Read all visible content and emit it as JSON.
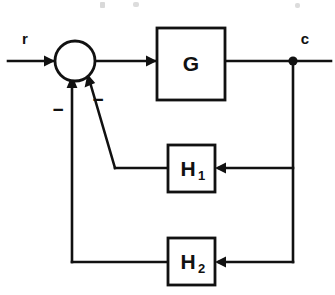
{
  "diagram": {
    "type": "control-system-block-diagram",
    "canvas": {
      "width": 335,
      "height": 295
    },
    "colors": {
      "ink": "#111111",
      "background": "#ffffff"
    }
  },
  "signals": {
    "input": {
      "label": "r",
      "x": 25,
      "y": 40
    },
    "output": {
      "label": "c",
      "x": 305,
      "y": 40
    }
  },
  "blocks": [
    {
      "id": "G",
      "label": "G",
      "subscript": "",
      "x": 157,
      "y": 28,
      "width": 68,
      "height": 72,
      "center_x": 191,
      "center_y": 64
    },
    {
      "id": "H1",
      "label": "H",
      "subscript": "1",
      "x": 168,
      "y": 145,
      "width": 47,
      "height": 47,
      "center_x": 191,
      "center_y": 170
    },
    {
      "id": "H2",
      "label": "H",
      "subscript": "2",
      "x": 168,
      "y": 238,
      "width": 47,
      "height": 47,
      "center_x": 191,
      "center_y": 263
    }
  ],
  "summing_junction": {
    "name": "summing-junction",
    "center_x": 75,
    "center_y": 61,
    "radius": 20,
    "signs": [
      {
        "label": "−",
        "x": 58,
        "y": 111,
        "for": "H2-feedback"
      },
      {
        "label": "−",
        "x": 98,
        "y": 101,
        "for": "H1-feedback"
      }
    ]
  },
  "nodes": [
    {
      "name": "takeoff-node-c",
      "x": 293,
      "y": 61,
      "radius": 4.6
    }
  ],
  "wires": {
    "input_line": {
      "from_x": 8,
      "to_x": 55,
      "y": 61
    },
    "sum_to_g": {
      "from_x": 95,
      "to_x": 157,
      "y": 61
    },
    "g_to_node": {
      "from_x": 225,
      "to_x": 293,
      "y": 61
    },
    "node_to_c": {
      "from_x": 293,
      "to_x": 331,
      "y": 61
    },
    "right_rail": {
      "x": 293,
      "from_y": 61,
      "to_y": 262
    },
    "h1_feed_in": {
      "from_x": 293,
      "to_x": 215,
      "y": 168
    },
    "h2_feed_in": {
      "from_x": 293,
      "to_x": 215,
      "y": 262
    },
    "h1_feed_out_h": {
      "from_x": 168,
      "to_x": 115,
      "y": 168
    },
    "h1_feed_out_diag": {
      "from_x": 115,
      "from_y": 168,
      "to_x": 89,
      "to_y": 80
    },
    "h2_feed_out_h": {
      "from_x": 168,
      "to_x": 72,
      "y": 262
    },
    "h2_feed_out_v": {
      "x": 72,
      "from_y": 262,
      "to_y": 82
    }
  }
}
